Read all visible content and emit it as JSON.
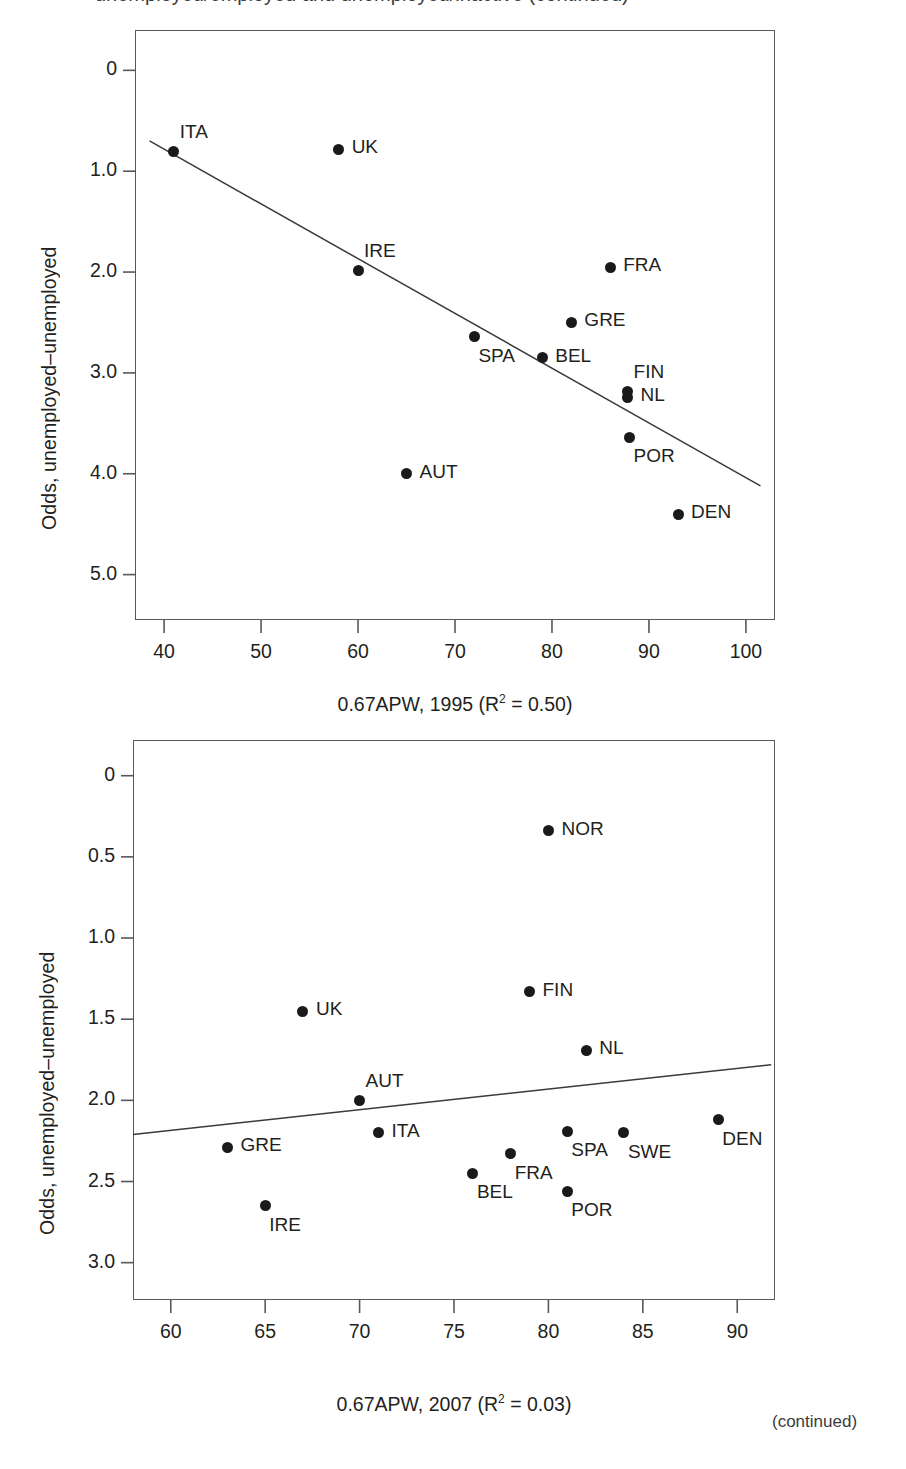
{
  "page": {
    "cut_off_header": "unemployed/employed and unemployed/inactive (continued)",
    "continued_note": "(continued)"
  },
  "charts": [
    {
      "id": "chart-1995",
      "ylabel": "Odds, unemployed–unemployed",
      "xlabel_html": "0.67APW, 1995 (R<sup>2</sup> = 0.50)",
      "xlabel_text": "0.67APW, 1995 (R2 = 0.50)",
      "yticks": [
        "5.0",
        "4.0",
        "3.0",
        "2.0",
        "1.0",
        "0"
      ],
      "xticks": [
        "40",
        "50",
        "60",
        "70",
        "80",
        "90",
        "100"
      ],
      "labels": [
        "ITA",
        "UK",
        "IRE",
        "FRA",
        "GRE",
        "SPA",
        "BEL",
        "FIN",
        "NL",
        "POR",
        "AUT",
        "DEN"
      ]
    },
    {
      "id": "chart-2007",
      "ylabel": "Odds, unemployed–unemployed",
      "xlabel_html": "0.67APW, 2007 (R<sup>2</sup> = 0.03)",
      "xlabel_text": "0.67APW, 2007 (R2 = 0.03)",
      "yticks": [
        "3.0",
        "2.5",
        "2.0",
        "1.5",
        "1.0",
        "0.5",
        "0"
      ],
      "xticks": [
        "60",
        "65",
        "70",
        "75",
        "80",
        "85",
        "90"
      ],
      "labels": [
        "NOR",
        "FIN",
        "UK",
        "NL",
        "AUT",
        "DEN",
        "SPA",
        "SWE",
        "ITA",
        "GRE",
        "FRA",
        "BEL",
        "POR",
        "IRE"
      ]
    }
  ],
  "chart_data": [
    {
      "type": "scatter",
      "title": "",
      "xlabel": "0.67APW, 1995 (R2 = 0.50)",
      "ylabel": "Odds, unemployed-unemployed",
      "xlim": [
        37,
        103
      ],
      "ylim": [
        -0.45,
        5.4
      ],
      "xticks": [
        40,
        50,
        60,
        70,
        80,
        90,
        100
      ],
      "yticks": [
        0,
        1.0,
        2.0,
        3.0,
        4.0,
        5.0
      ],
      "grid": false,
      "legend": "none",
      "r_squared": 0.5,
      "points": [
        {
          "label": "ITA",
          "x": 41,
          "y": 4.2,
          "label_pos": "above-right"
        },
        {
          "label": "UK",
          "x": 58,
          "y": 4.22,
          "label_pos": "right"
        },
        {
          "label": "IRE",
          "x": 60,
          "y": 3.02,
          "label_pos": "above-right"
        },
        {
          "label": "FRA",
          "x": 86,
          "y": 3.05,
          "label_pos": "right"
        },
        {
          "label": "GRE",
          "x": 82,
          "y": 2.5,
          "label_pos": "right"
        },
        {
          "label": "SPA",
          "x": 72,
          "y": 2.36,
          "label_pos": "below-right"
        },
        {
          "label": "BEL",
          "x": 79,
          "y": 2.15,
          "label_pos": "right"
        },
        {
          "label": "FIN",
          "x": 87.8,
          "y": 1.82,
          "label_pos": "above-right"
        },
        {
          "label": "NL",
          "x": 87.8,
          "y": 1.76,
          "label_pos": "right"
        },
        {
          "label": "POR",
          "x": 88,
          "y": 1.36,
          "label_pos": "below-right"
        },
        {
          "label": "AUT",
          "x": 65,
          "y": 1.0,
          "label_pos": "right"
        },
        {
          "label": "DEN",
          "x": 93,
          "y": 0.6,
          "label_pos": "right"
        }
      ],
      "trendline": {
        "x1": 38.5,
        "y1": 4.3,
        "x2": 101.5,
        "y2": 0.88
      }
    },
    {
      "type": "scatter",
      "title": "",
      "xlabel": "0.67APW, 2007 (R2 = 0.03)",
      "ylabel": "Odds, unemployed-unemployed",
      "xlim": [
        58,
        92
      ],
      "ylim": [
        -0.23,
        3.22
      ],
      "xticks": [
        60,
        65,
        70,
        75,
        80,
        85,
        90
      ],
      "yticks": [
        0,
        0.5,
        1.0,
        1.5,
        2.0,
        2.5,
        3.0
      ],
      "grid": false,
      "legend": "none",
      "r_squared": 0.03,
      "points": [
        {
          "label": "NOR",
          "x": 80,
          "y": 2.66,
          "label_pos": "right"
        },
        {
          "label": "FIN",
          "x": 79,
          "y": 1.67,
          "label_pos": "right"
        },
        {
          "label": "UK",
          "x": 67,
          "y": 1.55,
          "label_pos": "right"
        },
        {
          "label": "NL",
          "x": 82,
          "y": 1.31,
          "label_pos": "right"
        },
        {
          "label": "AUT",
          "x": 70,
          "y": 1.0,
          "label_pos": "above-right"
        },
        {
          "label": "DEN",
          "x": 89,
          "y": 0.88,
          "label_pos": "below-right"
        },
        {
          "label": "SPA",
          "x": 81,
          "y": 0.81,
          "label_pos": "below-right"
        },
        {
          "label": "SWE",
          "x": 84,
          "y": 0.8,
          "label_pos": "below-right"
        },
        {
          "label": "ITA",
          "x": 71,
          "y": 0.8,
          "label_pos": "right"
        },
        {
          "label": "GRE",
          "x": 63,
          "y": 0.71,
          "label_pos": "right"
        },
        {
          "label": "FRA",
          "x": 78,
          "y": 0.67,
          "label_pos": "below-right"
        },
        {
          "label": "BEL",
          "x": 76,
          "y": 0.55,
          "label_pos": "below-right"
        },
        {
          "label": "POR",
          "x": 81,
          "y": 0.44,
          "label_pos": "below-right"
        },
        {
          "label": "IRE",
          "x": 65,
          "y": 0.35,
          "label_pos": "below-right"
        }
      ],
      "trendline": {
        "x1": 58,
        "y1": 0.79,
        "x2": 91.8,
        "y2": 1.22
      }
    }
  ]
}
